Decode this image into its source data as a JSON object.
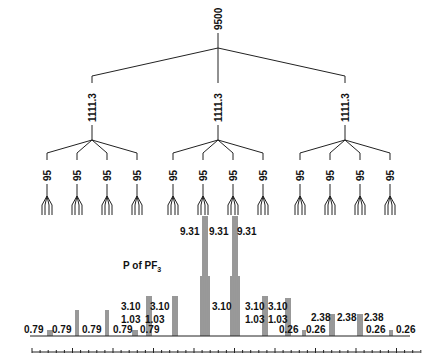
{
  "diagram": {
    "root_coupling": "9500",
    "level2_coupling": "1111.3",
    "level3_coupling": "95",
    "nucleus_label": "P of PF",
    "nucleus_subscript": "3",
    "peak_labels": {
      "top_row": [
        "9.31",
        "9.31",
        "9.31"
      ],
      "middle_row_3_10": [
        "3.10",
        "3.10",
        "3.10",
        "3.10",
        "3.10"
      ],
      "middle_row_1_03": [
        "1.03",
        "1.03",
        "1.03",
        "1.03"
      ],
      "right_row_2_38": [
        "2.38",
        "2.38",
        "2.38"
      ],
      "left_baseline_0_79": [
        "0.79",
        "0.79",
        "0.79",
        "0.79",
        "0.79"
      ],
      "right_baseline_0_26": [
        "0.26",
        "0.26",
        "0.26",
        "0.26",
        "0.26"
      ]
    },
    "colors": {
      "line": "#222222",
      "text": "#111111",
      "background": "#ffffff"
    }
  }
}
